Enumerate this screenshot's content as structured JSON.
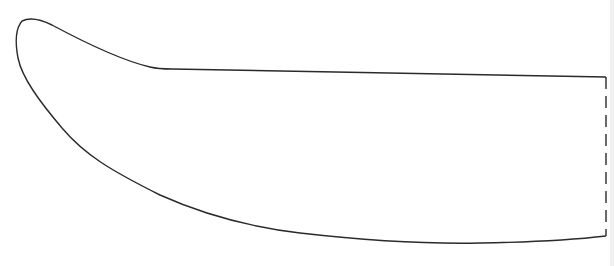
{
  "figure": {
    "line_color": "#2a2a2a",
    "background_color": "#ffffff",
    "edges": [
      {
        "name": "spine",
        "style": "solid"
      },
      {
        "name": "tip",
        "style": "solid"
      },
      {
        "name": "cutting-edge",
        "style": "solid"
      },
      {
        "name": "break-line",
        "style": "dashed"
      }
    ]
  }
}
